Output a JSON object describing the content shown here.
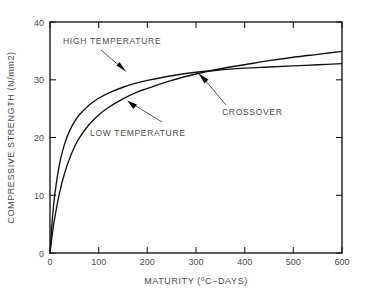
{
  "chart_data": {
    "type": "line",
    "title": "",
    "xlabel": "MATURITY (ºC−DAYS)",
    "ylabel": "COMPRESSIVE STRENGTH (N/mm2)",
    "xlim": [
      0,
      600
    ],
    "ylim": [
      0,
      40
    ],
    "grid": false,
    "legend_position": "none",
    "xticks": [
      0,
      100,
      200,
      300,
      400,
      500,
      600
    ],
    "yticks": [
      0,
      10,
      20,
      30,
      40
    ],
    "xtick_labels": [
      "0",
      "100",
      "200",
      "300",
      "400",
      "500",
      "600"
    ],
    "ytick_labels": [
      "0",
      "10",
      "20",
      "30",
      "40"
    ],
    "series": [
      {
        "name": "HIGH TEMPERATURE",
        "x": [
          0,
          5,
          10,
          20,
          30,
          40,
          50,
          60,
          80,
          100,
          120,
          150,
          180,
          200,
          250,
          300,
          350,
          400,
          450,
          500,
          550,
          600
        ],
        "values": [
          0,
          6.0,
          10.2,
          15.6,
          18.9,
          21.1,
          22.7,
          23.9,
          25.6,
          26.8,
          27.7,
          28.7,
          29.5,
          29.9,
          30.7,
          31.3,
          31.7,
          32.0,
          32.2,
          32.4,
          32.6,
          32.8
        ]
      },
      {
        "name": "LOW TEMPERATURE",
        "x": [
          0,
          5,
          10,
          20,
          30,
          40,
          50,
          60,
          80,
          100,
          120,
          150,
          180,
          200,
          250,
          300,
          350,
          400,
          450,
          500,
          550,
          600
        ],
        "values": [
          0,
          3.4,
          6.2,
          10.6,
          13.8,
          16.3,
          18.3,
          19.9,
          22.2,
          23.9,
          25.2,
          26.7,
          27.9,
          28.5,
          29.9,
          31.0,
          31.9,
          32.6,
          33.3,
          33.9,
          34.4,
          34.9
        ]
      }
    ],
    "annotations": [
      {
        "name": "high-temperature",
        "label": "HIGH  TEMPERATURE",
        "point": [
          123,
          29.5
        ],
        "text_position": [
          28,
          36.4
        ]
      },
      {
        "name": "low-temperature",
        "label": "LOW  TEMPERATURE",
        "point": [
          160,
          26.5
        ],
        "text_position": [
          168,
          21.6
        ]
      },
      {
        "name": "crossover",
        "label": "CROSSOVER",
        "point": [
          305,
          31.4
        ],
        "text_position": [
          322,
          24.8
        ]
      }
    ],
    "colors": {
      "curve": "#111111",
      "axis": "#1a1a1a",
      "text": "#4a4a4a",
      "background": "#ffffff"
    }
  }
}
